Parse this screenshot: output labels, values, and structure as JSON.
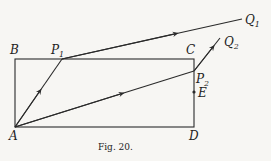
{
  "figure": {
    "caption": "Fig. 20.",
    "points": {
      "A": {
        "label": "A",
        "x": 15,
        "y": 127
      },
      "B": {
        "label": "B",
        "x": 15,
        "y": 59
      },
      "C": {
        "label": "C",
        "x": 194,
        "y": 59
      },
      "D": {
        "label": "D",
        "x": 194,
        "y": 127
      },
      "E": {
        "label": "E",
        "x": 194,
        "y": 92
      },
      "P1": {
        "label": "P",
        "sub": "1",
        "x": 62,
        "y": 59
      },
      "P2": {
        "label": "P",
        "sub": "2",
        "x": 194,
        "y": 71
      },
      "Q1": {
        "label": "Q",
        "sub": "1",
        "x": 242,
        "y": 19
      },
      "Q2": {
        "label": "Q",
        "sub": "2",
        "x": 220,
        "y": 38
      }
    },
    "rectangle": [
      "A",
      "B",
      "C",
      "D"
    ],
    "paths": [
      {
        "name": "path-1",
        "points": [
          "A",
          "P1",
          "Q1"
        ]
      },
      {
        "name": "path-2",
        "points": [
          "A",
          "P2",
          "Q2"
        ]
      }
    ],
    "line_color": "#2a2a2a",
    "background": "#f7f6f3"
  }
}
